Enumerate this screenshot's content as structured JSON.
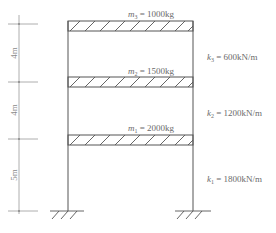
{
  "diagram": {
    "type": "three-storey shear frame",
    "colors": {
      "line": "#555555",
      "dim_line": "#9a9a9a",
      "text": "#6a6a6a"
    },
    "floors": [
      {
        "id": "m3",
        "symbol": "m",
        "sub": "3",
        "eq": " = 1000kg",
        "label": "m3 = 1000kg"
      },
      {
        "id": "m2",
        "symbol": "m",
        "sub": "2",
        "eq": " = 1500kg",
        "label": "m2 = 1500kg"
      },
      {
        "id": "m1",
        "symbol": "m",
        "sub": "1",
        "eq": " = 2000kg",
        "label": "m1 = 2000kg"
      }
    ],
    "stiffness": [
      {
        "id": "k3",
        "symbol": "k",
        "sub": "3",
        "eq": " = 600kN/m",
        "label": "k3 = 600kN/m"
      },
      {
        "id": "k2",
        "symbol": "k",
        "sub": "2",
        "eq": " = 1200kN/m",
        "label": "k2 = 1200kN/m"
      },
      {
        "id": "k1",
        "symbol": "k",
        "sub": "1",
        "eq": " = 1800kN/m",
        "label": "k1 = 1800kN/m"
      }
    ],
    "dimensions": [
      {
        "id": "h3",
        "label": "4m"
      },
      {
        "id": "h2",
        "label": "4m"
      },
      {
        "id": "h1",
        "label": "5m"
      }
    ]
  }
}
